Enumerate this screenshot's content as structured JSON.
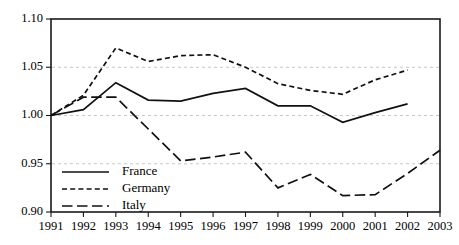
{
  "chart_data": {
    "type": "line",
    "title": "",
    "subtitle": "",
    "xlabel": "",
    "ylabel": "",
    "x": [
      1991,
      1992,
      1993,
      1994,
      1995,
      1996,
      1997,
      1998,
      1999,
      2000,
      2001,
      2002,
      2003
    ],
    "categories": [
      "1991",
      "1992",
      "1993",
      "1994",
      "1995",
      "1996",
      "1997",
      "1998",
      "1999",
      "2000",
      "2001",
      "2002",
      "2003"
    ],
    "xlim": [
      1991,
      2003
    ],
    "ylim": [
      0.9,
      1.1
    ],
    "yticks": [
      0.9,
      0.95,
      1.0,
      1.05,
      1.1
    ],
    "ytick_labels": [
      "0.90",
      "0.95",
      "1.00",
      "1.05",
      "1.10"
    ],
    "xticks": [
      1991,
      1992,
      1993,
      1994,
      1995,
      1996,
      1997,
      1998,
      1999,
      2000,
      2001,
      2002,
      2003
    ],
    "xtick_labels": [
      "1991",
      "1992",
      "1993",
      "1994",
      "1995",
      "1996",
      "1997",
      "1998",
      "1999",
      "2000",
      "2001",
      "2002",
      "2003"
    ],
    "grid": "horizontal-dashed",
    "legend_position": "bottom-left",
    "line_color": "#111111",
    "grid_color": "#b9b9b9",
    "frame_color": "#1a1a1a",
    "series": [
      {
        "name": "France",
        "style": "solid",
        "x": [
          1991,
          1992,
          1993,
          1994,
          1995,
          1996,
          1997,
          1998,
          1999,
          2000,
          2001,
          2002
        ],
        "values": [
          1.0,
          1.006,
          1.034,
          1.016,
          1.015,
          1.023,
          1.028,
          1.01,
          1.01,
          0.993,
          1.003,
          1.012
        ]
      },
      {
        "name": "Germany",
        "style": "short-dash",
        "x": [
          1991,
          1992,
          1993,
          1994,
          1995,
          1996,
          1997,
          1998,
          1999,
          2000,
          2001,
          2002
        ],
        "values": [
          1.0,
          1.021,
          1.07,
          1.056,
          1.062,
          1.063,
          1.05,
          1.033,
          1.026,
          1.022,
          1.037,
          1.047
        ]
      },
      {
        "name": "Italy",
        "style": "long-dash",
        "x": [
          1991,
          1992,
          1993,
          1994,
          1995,
          1996,
          1997,
          1998,
          1999,
          2000,
          2001,
          2002,
          2003
        ],
        "values": [
          1.0,
          1.019,
          1.019,
          0.986,
          0.953,
          0.957,
          0.962,
          0.925,
          0.939,
          0.917,
          0.918,
          0.94,
          0.964
        ]
      }
    ],
    "legend": [
      {
        "label": "France",
        "style": "solid"
      },
      {
        "label": "Germany",
        "style": "short-dash"
      },
      {
        "label": "Italy",
        "style": "long-dash"
      }
    ]
  }
}
